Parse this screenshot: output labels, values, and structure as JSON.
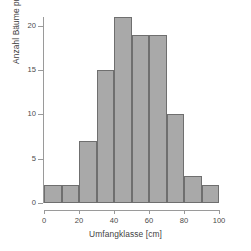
{
  "chart_data": {
    "type": "bar",
    "title": "",
    "subtitle": "",
    "xlabel": "Umfangklasse [cm]",
    "ylabel": "Anzahl Bäume pro Klasse",
    "categories": [
      "0-10",
      "10-20",
      "20-30",
      "30-40",
      "40-50",
      "50-60",
      "60-70",
      "70-80",
      "80-90",
      "90-100"
    ],
    "bin_edges": [
      0,
      10,
      20,
      30,
      40,
      50,
      60,
      70,
      80,
      90,
      100
    ],
    "values": [
      2,
      2,
      7,
      15,
      21,
      19,
      19,
      10,
      3,
      2
    ],
    "xlim": [
      0,
      100
    ],
    "ylim": [
      0,
      21
    ],
    "y_axis_max": 20,
    "xticks": [
      0,
      20,
      40,
      60,
      80,
      100
    ],
    "xtick_labels": [
      "0",
      "20",
      "40",
      "60",
      "80",
      "100"
    ],
    "x_minor_ticks": [
      10,
      30,
      50,
      70,
      90
    ],
    "yticks": [
      0,
      5,
      10,
      15,
      20
    ],
    "ytick_labels": [
      "0",
      "5",
      "10",
      "15",
      "20"
    ],
    "grid": false,
    "legend": null,
    "legend_position": "none",
    "bar_fill_color": "#a9a9a9",
    "bar_edge_color": "#6f6f6f",
    "axis_color": "#9a9a9a",
    "background_color": "#ffffff",
    "text_color": "#4a4a4a"
  }
}
